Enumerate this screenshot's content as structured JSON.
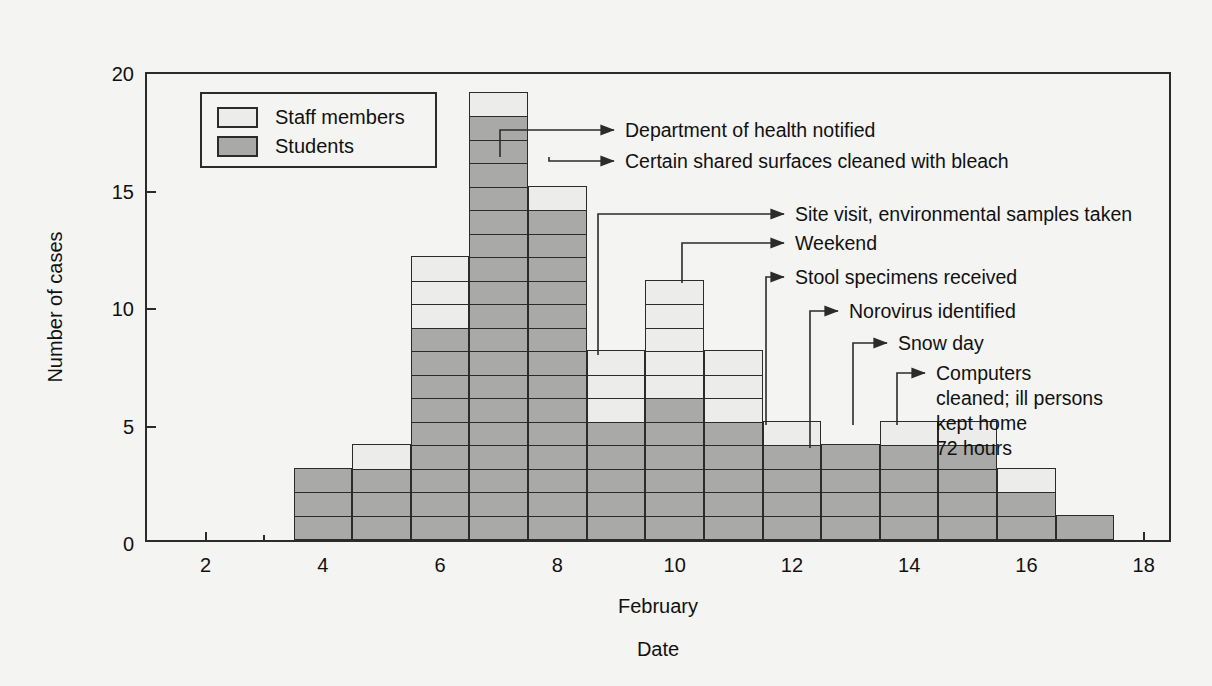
{
  "chart_data": {
    "type": "bar",
    "title": "",
    "subtitle": "",
    "xlabel_primary": "February",
    "xlabel_secondary": "Date",
    "ylabel": "Number of cases",
    "ylim": [
      0,
      20
    ],
    "yticks": [
      0,
      5,
      10,
      15,
      20
    ],
    "xlim": [
      1,
      18.5
    ],
    "xticks": [
      2,
      4,
      6,
      8,
      10,
      12,
      14,
      16,
      18
    ],
    "grid": false,
    "stacked": true,
    "legend_position": "top-left",
    "categories": [
      4,
      5,
      6,
      7,
      8,
      9,
      10,
      11,
      12,
      13,
      14,
      15,
      16,
      17
    ],
    "series": [
      {
        "name": "Students",
        "color": "#a9a9a7",
        "values": [
          3,
          3,
          9,
          18,
          14,
          5,
          6,
          5,
          4,
          4,
          4,
          4,
          2,
          1
        ]
      },
      {
        "name": "Staff members",
        "color": "#ececeb",
        "values": [
          0,
          1,
          3,
          1,
          1,
          3,
          5,
          3,
          1,
          0,
          1,
          1,
          1,
          0
        ]
      }
    ],
    "totals": [
      3,
      4,
      12,
      19,
      15,
      8,
      11,
      8,
      5,
      4,
      5,
      5,
      3,
      1
    ],
    "annotations": [
      {
        "label": "Department of health notified",
        "anchor_date": 7.5,
        "anchor_value": 15
      },
      {
        "label": "Certain shared surfaces cleaned with bleach",
        "anchor_date": 8.0,
        "anchor_value": 15
      },
      {
        "label": "Site visit, environmental samples taken",
        "anchor_date": 9.5,
        "anchor_value": 8
      },
      {
        "label": "Weekend",
        "anchor_date": 10.5,
        "anchor_value": 11
      },
      {
        "label": "Stool specimens received",
        "anchor_date": 12.0,
        "anchor_value": 5
      },
      {
        "label": "Norovirus identified",
        "anchor_date": 13.0,
        "anchor_value": 4
      },
      {
        "label": "Snow day",
        "anchor_date": 14.0,
        "anchor_value": 5
      },
      {
        "label": "Computers\ncleaned; ill persons\nkept home\n72 hours",
        "anchor_date": 15.0,
        "anchor_value": 5
      }
    ]
  },
  "legend": {
    "items": [
      {
        "label": "Staff members",
        "key": "staff"
      },
      {
        "label": "Students",
        "key": "students"
      }
    ]
  },
  "axes": {
    "y_label": "Number of cases",
    "y_ticks": [
      "0",
      "5",
      "10",
      "15",
      "20"
    ],
    "x_ticks": [
      "2",
      "4",
      "6",
      "8",
      "10",
      "12",
      "14",
      "16",
      "18"
    ],
    "x_label_month": "February",
    "x_label_date": "Date"
  },
  "annotation_labels": {
    "a0": "Department of health notified",
    "a1": "Certain shared surfaces cleaned with bleach",
    "a2": "Site visit, environmental samples taken",
    "a3": "Weekend",
    "a4": "Stool specimens received",
    "a5": "Norovirus identified",
    "a6": "Snow day",
    "a7_line1": "Computers",
    "a7_line2": "cleaned; ill persons",
    "a7_line3": "kept home",
    "a7_line4": "72 hours"
  },
  "colors": {
    "students": "#a9a9a7",
    "staff": "#ececeb",
    "ink": "#2b2b2b",
    "background": "#f4f4f2"
  }
}
